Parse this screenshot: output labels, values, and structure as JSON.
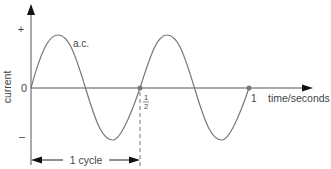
{
  "diagram": {
    "type": "ac_current_waveform",
    "y_axis": {
      "label": "current",
      "ticks": [
        {
          "label": "+",
          "position": "positive"
        },
        {
          "label": "0",
          "position": "zero"
        },
        {
          "label": "–",
          "position": "negative"
        }
      ]
    },
    "x_axis": {
      "label": "time/seconds",
      "ticks": [
        {
          "label_num": "1",
          "label_den": "2",
          "value": 0.5
        },
        {
          "label": "1",
          "value": 1
        }
      ]
    },
    "curve": {
      "label": "a.c.",
      "cycles_shown": 2,
      "frequency_hz": 2
    },
    "annotation": {
      "label": "1 cycle",
      "from": 0,
      "to": 0.5
    },
    "colors": {
      "axis": "#555555",
      "curve": "#777777",
      "dashed": "#777777",
      "text": "#444444",
      "marker": "#777777"
    }
  }
}
